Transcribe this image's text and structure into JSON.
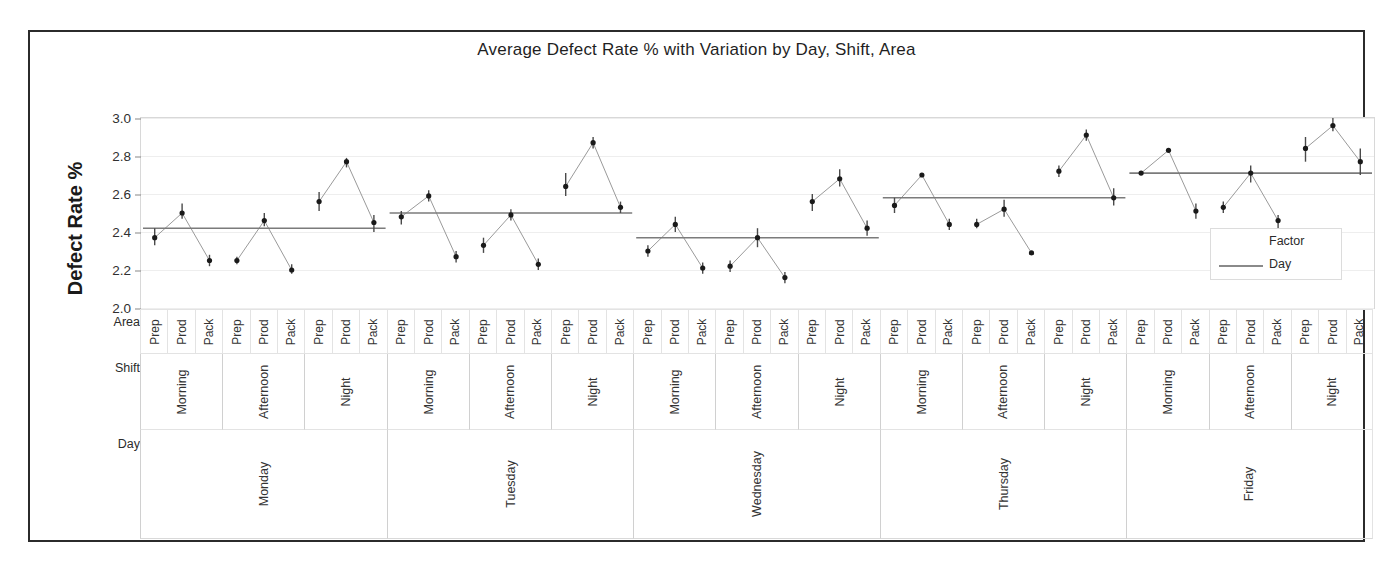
{
  "chart_data": {
    "type": "line",
    "title": "Average Defect Rate % with Variation by Day, Shift, Area",
    "xlabel": "",
    "ylabel": "Defect Rate %",
    "ylim": [
      2.0,
      3.0
    ],
    "yticks": [
      "2.0",
      "2.2",
      "2.4",
      "2.6",
      "2.8",
      "3.0"
    ],
    "grid": true,
    "legend_position": "inside-right",
    "legend": {
      "title": "Factor",
      "entries": [
        "Day"
      ]
    },
    "axis_levels": [
      {
        "name": "Area",
        "labels": [
          "Prep",
          "Prod",
          "Pack"
        ]
      },
      {
        "name": "Shift",
        "labels": [
          "Morning",
          "Afternoon",
          "Night"
        ]
      },
      {
        "name": "Day",
        "labels": [
          "Monday",
          "Tuesday",
          "Wednesday",
          "Thursday",
          "Friday"
        ]
      }
    ],
    "day_reference_lines": [
      {
        "day": "Monday",
        "value": 2.42
      },
      {
        "day": "Tuesday",
        "value": 2.5
      },
      {
        "day": "Wednesday",
        "value": 2.37
      },
      {
        "day": "Thursday",
        "value": 2.58
      },
      {
        "day": "Friday",
        "value": 2.71
      }
    ],
    "groups": [
      {
        "day": "Monday",
        "shifts": [
          {
            "shift": "Morning",
            "areas": [
              "Prep",
              "Prod",
              "Pack"
            ],
            "values": [
              2.37,
              2.5,
              2.25
            ],
            "err_low": [
              2.33,
              2.47,
              2.22
            ],
            "err_high": [
              2.42,
              2.55,
              2.28
            ]
          },
          {
            "shift": "Afternoon",
            "areas": [
              "Prep",
              "Prod",
              "Pack"
            ],
            "values": [
              2.25,
              2.46,
              2.2
            ],
            "err_low": [
              2.23,
              2.43,
              2.18
            ],
            "err_high": [
              2.27,
              2.5,
              2.23
            ]
          },
          {
            "shift": "Night",
            "areas": [
              "Prep",
              "Prod",
              "Pack"
            ],
            "values": [
              2.56,
              2.77,
              2.45
            ],
            "err_low": [
              2.51,
              2.74,
              2.4
            ],
            "err_high": [
              2.61,
              2.79,
              2.49
            ]
          }
        ]
      },
      {
        "day": "Tuesday",
        "shifts": [
          {
            "shift": "Morning",
            "areas": [
              "Prep",
              "Prod",
              "Pack"
            ],
            "values": [
              2.48,
              2.59,
              2.27
            ],
            "err_low": [
              2.44,
              2.56,
              2.24
            ],
            "err_high": [
              2.51,
              2.62,
              2.3
            ]
          },
          {
            "shift": "Afternoon",
            "areas": [
              "Prep",
              "Prod",
              "Pack"
            ],
            "values": [
              2.33,
              2.49,
              2.23
            ],
            "err_low": [
              2.29,
              2.46,
              2.2
            ],
            "err_high": [
              2.37,
              2.52,
              2.26
            ]
          },
          {
            "shift": "Night",
            "areas": [
              "Prep",
              "Prod",
              "Pack"
            ],
            "values": [
              2.64,
              2.87,
              2.53
            ],
            "err_low": [
              2.59,
              2.84,
              2.5
            ],
            "err_high": [
              2.71,
              2.9,
              2.56
            ]
          }
        ]
      },
      {
        "day": "Wednesday",
        "shifts": [
          {
            "shift": "Morning",
            "areas": [
              "Prep",
              "Prod",
              "Pack"
            ],
            "values": [
              2.3,
              2.44,
              2.21
            ],
            "err_low": [
              2.27,
              2.4,
              2.18
            ],
            "err_high": [
              2.33,
              2.48,
              2.24
            ]
          },
          {
            "shift": "Afternoon",
            "areas": [
              "Prep",
              "Prod",
              "Pack"
            ],
            "values": [
              2.22,
              2.37,
              2.16
            ],
            "err_low": [
              2.19,
              2.32,
              2.13
            ],
            "err_high": [
              2.25,
              2.42,
              2.19
            ]
          },
          {
            "shift": "Night",
            "areas": [
              "Prep",
              "Prod",
              "Pack"
            ],
            "values": [
              2.56,
              2.68,
              2.42
            ],
            "err_low": [
              2.51,
              2.64,
              2.38
            ],
            "err_high": [
              2.6,
              2.73,
              2.46
            ]
          }
        ]
      },
      {
        "day": "Thursday",
        "shifts": [
          {
            "shift": "Morning",
            "areas": [
              "Prep",
              "Prod",
              "Pack"
            ],
            "values": [
              2.54,
              2.7,
              2.44
            ],
            "err_low": [
              2.5,
              2.7,
              2.41
            ],
            "err_high": [
              2.58,
              2.7,
              2.47
            ]
          },
          {
            "shift": "Afternoon",
            "areas": [
              "Prep",
              "Prod",
              "Pack"
            ],
            "values": [
              2.44,
              2.52,
              2.29
            ],
            "err_low": [
              2.42,
              2.48,
              2.29
            ],
            "err_high": [
              2.47,
              2.57,
              2.29
            ]
          },
          {
            "shift": "Night",
            "areas": [
              "Prep",
              "Prod",
              "Pack"
            ],
            "values": [
              2.72,
              2.91,
              2.58
            ],
            "err_low": [
              2.69,
              2.88,
              2.54
            ],
            "err_high": [
              2.75,
              2.94,
              2.63
            ]
          }
        ]
      },
      {
        "day": "Friday",
        "shifts": [
          {
            "shift": "Morning",
            "areas": [
              "Prep",
              "Prod",
              "Pack"
            ],
            "values": [
              2.71,
              2.83,
              2.51
            ],
            "err_low": [
              2.71,
              2.83,
              2.47
            ],
            "err_high": [
              2.71,
              2.83,
              2.55
            ]
          },
          {
            "shift": "Afternoon",
            "areas": [
              "Prep",
              "Prod",
              "Pack"
            ],
            "values": [
              2.53,
              2.71,
              2.46
            ],
            "err_low": [
              2.5,
              2.66,
              2.42
            ],
            "err_high": [
              2.56,
              2.75,
              2.49
            ]
          },
          {
            "shift": "Night",
            "areas": [
              "Prep",
              "Prod",
              "Pack"
            ],
            "values": [
              2.84,
              2.96,
              2.77
            ],
            "err_low": [
              2.77,
              2.93,
              2.7
            ],
            "err_high": [
              2.9,
              3.0,
              2.84
            ]
          }
        ]
      }
    ],
    "colors": {
      "marker": "#1a1a1a",
      "connector": "#9a9a9a",
      "reference_line": "#7b7b7b",
      "grid": "#eeeeee",
      "border": "#2b2b2b"
    }
  }
}
